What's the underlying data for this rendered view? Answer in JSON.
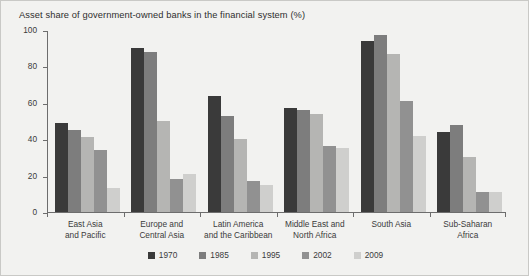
{
  "chart_data": {
    "type": "bar",
    "title": "Asset share of government-owned banks in the financial system (%)",
    "xlabel": "",
    "ylabel": "",
    "ylim": [
      0,
      100
    ],
    "yticks": [
      0,
      20,
      40,
      60,
      80,
      100
    ],
    "grid": false,
    "legend_position": "bottom-center",
    "categories": [
      "East Asia\nand Pacific",
      "Europe and\nCentral Asia",
      "Latin America\nand the Caribbean",
      "Middle East and\nNorth Africa",
      "South Asia",
      "Sub-Saharan\nAfrica"
    ],
    "series": [
      {
        "name": "1970",
        "color": "#3a3a3a",
        "values": [
          49,
          90,
          64,
          57,
          94,
          44
        ]
      },
      {
        "name": "1985",
        "color": "#7d7d7d",
        "values": [
          45,
          88,
          53,
          56,
          97,
          48
        ]
      },
      {
        "name": "1995",
        "color": "#b5b5b3",
        "values": [
          41,
          50,
          40,
          54,
          87,
          30
        ]
      },
      {
        "name": "2002",
        "color": "#919191",
        "values": [
          34,
          18,
          17,
          36,
          61,
          11
        ]
      },
      {
        "name": "2009",
        "color": "#cfcfcd",
        "values": [
          13,
          21,
          15,
          35,
          42,
          11
        ]
      }
    ]
  },
  "style": {
    "figure_background": "#f2f2f0",
    "plot_background": "#f2f2f0",
    "axis_color": "#6d6d6d",
    "text_color": "#3b3b3b",
    "border_color": "#c9c9c6"
  }
}
